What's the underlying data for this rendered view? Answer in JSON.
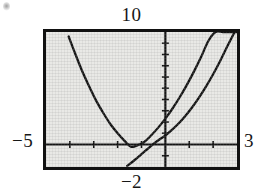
{
  "figure": {
    "caption_labels": {
      "y_max": "10",
      "y_min": "−2",
      "x_min": "−5",
      "x_max": "3"
    }
  },
  "chart_data": {
    "type": "line",
    "title": "",
    "subtitle": "",
    "xlabel": "",
    "ylabel": "",
    "xlim": [
      -5,
      3
    ],
    "ylim": [
      -2,
      10
    ],
    "grid": false,
    "legend": false,
    "legend_position": "none",
    "axis_style": "calculator-screen",
    "x_axis_tick_interval": 1,
    "y_axis_tick_interval": 1,
    "x_tick_values": [
      -4,
      -3,
      -2,
      -1,
      1,
      2
    ],
    "y_tick_values": [
      -1,
      1,
      2,
      3,
      4,
      5,
      6,
      7,
      8,
      9
    ],
    "annotations": [
      {
        "label": "−5",
        "position": "left-of-screen",
        "meaning": "window x minimum"
      },
      {
        "label": "3",
        "position": "right-of-screen",
        "meaning": "window x maximum"
      },
      {
        "label": "10",
        "position": "above-screen",
        "meaning": "window y maximum"
      },
      {
        "label": "−2",
        "position": "below-screen",
        "meaning": "window y minimum"
      }
    ],
    "series": [
      {
        "name": "parabola",
        "style": "solid",
        "color": "#141414",
        "vertex": [
          -1.45,
          -0.55
        ],
        "x": [
          -4.05,
          -3.8,
          -3.5,
          -3.2,
          -2.9,
          -2.6,
          -2.3,
          -2.0,
          -1.7,
          -1.45,
          -1.2,
          -0.9,
          -0.6,
          -0.3,
          0.0,
          0.3,
          0.6,
          0.9,
          1.2,
          1.5,
          1.8,
          2.1,
          2.4,
          2.7,
          3.0
        ],
        "y": [
          9.6,
          8.2,
          6.6,
          5.2,
          3.9,
          2.8,
          1.8,
          1.0,
          0.3,
          -0.2,
          -0.1,
          0.2,
          0.8,
          1.5,
          2.3,
          3.2,
          4.2,
          5.3,
          6.5,
          7.8,
          9.2,
          10.0,
          10.0,
          10.0,
          10.0
        ]
      },
      {
        "name": "second-curve",
        "style": "solid",
        "color": "#141414",
        "x": [
          -1.6,
          -1.3,
          -1.0,
          -0.75,
          -0.5,
          -0.25,
          0.0,
          0.25,
          0.5,
          0.8,
          1.1,
          1.4,
          1.7,
          2.0,
          2.3,
          2.6,
          2.9
        ],
        "y": [
          -1.9,
          -1.4,
          -0.85,
          -0.4,
          0.05,
          0.45,
          0.8,
          1.25,
          1.75,
          2.45,
          3.25,
          4.15,
          5.15,
          6.25,
          7.45,
          8.75,
          10.0
        ]
      }
    ],
    "intersections": [
      {
        "x": -0.45,
        "y": 0.15,
        "note": "curves cross just left of the y-axis, above the x-axis"
      },
      {
        "x": -0.1,
        "y": 0.7,
        "note": "second crossing forming a small lens/loop near the origin"
      }
    ]
  }
}
